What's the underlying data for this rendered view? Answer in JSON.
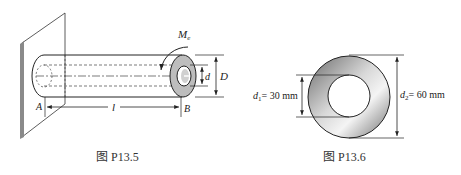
{
  "figures": [
    {
      "id": "P13.5",
      "caption": "图 P13.5",
      "labels": {
        "moment": "M",
        "moment_sub": "e",
        "outer_diameter": "D",
        "inner_diameter": "d",
        "length": "l",
        "fixed_end": "A",
        "free_end": "B"
      }
    },
    {
      "id": "P13.6",
      "caption": "图 P13.6",
      "labels": {
        "inner_diameter_symbol": "d",
        "inner_diameter_sub": "1",
        "inner_diameter_value": "= 30 mm",
        "outer_diameter_symbol": "d",
        "outer_diameter_sub": "2",
        "outer_diameter_value": "= 60 mm"
      }
    }
  ],
  "colors": {
    "line": "#222222",
    "wall": "#8a8a8a",
    "ring_dark": "#555555",
    "ring_light": "#f2f2f2",
    "cap_fill": "#bdbdbd"
  }
}
